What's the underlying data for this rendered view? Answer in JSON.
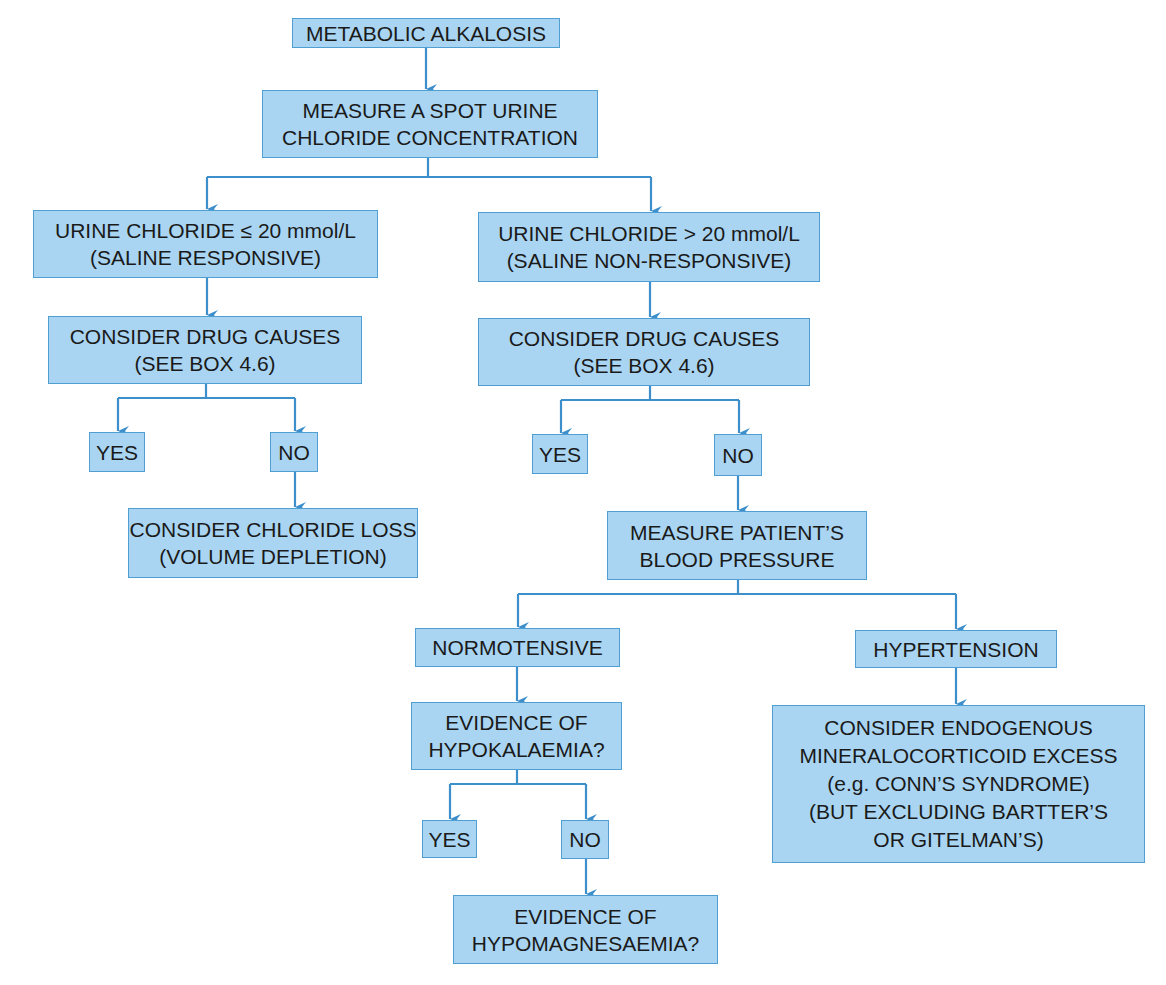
{
  "diagram": {
    "title": "METABOLIC ALKALOSIS",
    "colors": {
      "box_fill": "#a9d5f2",
      "box_border": "#4f9fd2",
      "connector": "#3d8fcc",
      "text": "#1a1a1a"
    },
    "nodes": {
      "root": {
        "lines": [
          "METABOLIC ALKALOSIS"
        ]
      },
      "measure_urine": {
        "lines": [
          "MEASURE A SPOT URINE",
          "CHLORIDE CONCENTRATION"
        ]
      },
      "low_chloride": {
        "lines": [
          "URINE CHLORIDE ≤ 20 mmol/L",
          "(SALINE RESPONSIVE)"
        ]
      },
      "high_chloride": {
        "lines": [
          "URINE CHLORIDE > 20 mmol/L",
          "(SALINE NON-RESPONSIVE)"
        ]
      },
      "drug_left": {
        "lines": [
          "CONSIDER DRUG CAUSES",
          "(SEE BOX 4.6)"
        ]
      },
      "drug_right": {
        "lines": [
          "CONSIDER DRUG CAUSES",
          "(SEE BOX 4.6)"
        ]
      },
      "yes_left": {
        "lines": [
          "YES"
        ]
      },
      "no_left": {
        "lines": [
          "NO"
        ]
      },
      "chloride_loss": {
        "lines": [
          "CONSIDER CHLORIDE LOSS",
          "(VOLUME DEPLETION)"
        ]
      },
      "yes_right": {
        "lines": [
          "YES"
        ]
      },
      "no_right": {
        "lines": [
          "NO"
        ]
      },
      "blood_pressure": {
        "lines": [
          "MEASURE PATIENT’S",
          "BLOOD PRESSURE"
        ]
      },
      "normotensive": {
        "lines": [
          "NORMOTENSIVE"
        ]
      },
      "hypertension": {
        "lines": [
          "HYPERTENSION"
        ]
      },
      "hypokalaemia": {
        "lines": [
          "EVIDENCE OF",
          "HYPOKALAEMIA?"
        ]
      },
      "endogenous": {
        "lines": [
          "CONSIDER ENDOGENOUS",
          "MINERALOCORTICOID EXCESS",
          "(e.g. CONN’S SYNDROME)",
          "(BUT EXCLUDING BARTTER’S",
          "OR GITELMAN’S)"
        ]
      },
      "yes_hypok": {
        "lines": [
          "YES"
        ]
      },
      "no_hypok": {
        "lines": [
          "NO"
        ]
      },
      "hypomagnesaemia": {
        "lines": [
          "EVIDENCE OF",
          "HYPOMAGNESAEMIA?"
        ]
      }
    },
    "edges": [
      [
        "root",
        "measure_urine"
      ],
      [
        "measure_urine",
        "low_chloride"
      ],
      [
        "measure_urine",
        "high_chloride"
      ],
      [
        "low_chloride",
        "drug_left"
      ],
      [
        "drug_left",
        "yes_left"
      ],
      [
        "drug_left",
        "no_left"
      ],
      [
        "no_left",
        "chloride_loss"
      ],
      [
        "high_chloride",
        "drug_right"
      ],
      [
        "drug_right",
        "yes_right"
      ],
      [
        "drug_right",
        "no_right"
      ],
      [
        "no_right",
        "blood_pressure"
      ],
      [
        "blood_pressure",
        "normotensive"
      ],
      [
        "blood_pressure",
        "hypertension"
      ],
      [
        "normotensive",
        "hypokalaemia"
      ],
      [
        "hypertension",
        "endogenous"
      ],
      [
        "hypokalaemia",
        "yes_hypok"
      ],
      [
        "hypokalaemia",
        "no_hypok"
      ],
      [
        "no_hypok",
        "hypomagnesaemia"
      ]
    ]
  }
}
